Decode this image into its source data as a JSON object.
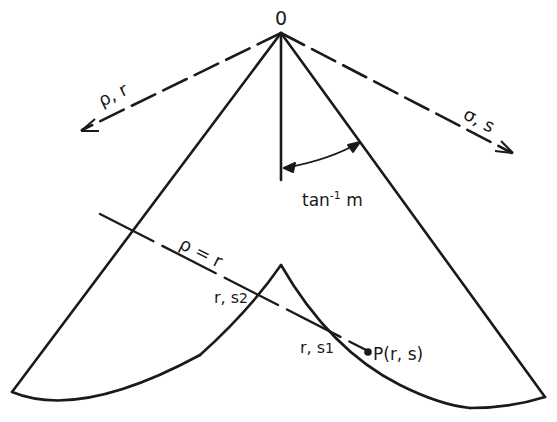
{
  "diagram": {
    "origin_label": "0",
    "left_axis_label": "ρ, r",
    "right_axis_label": "σ, s",
    "angle_label": "tan",
    "angle_label_sup": "-1",
    "angle_label_suffix": " m",
    "line_label": "ρ = r",
    "point_s2_label": "r, s",
    "point_s2_sub": "2",
    "point_s1_label": "r, s",
    "point_s1_sub": "1",
    "point_p_label": "P(r, s)",
    "stroke_color": "#1a1a1a",
    "background_color": "#ffffff"
  }
}
